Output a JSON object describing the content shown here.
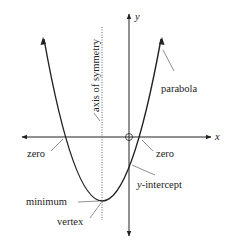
{
  "diagram": {
    "axes": {
      "x_label": "x",
      "y_label": "y"
    },
    "labels": {
      "axis_of_symmetry": "axis of symmetry",
      "parabola": "parabola",
      "zero_left": "zero",
      "zero_right": "zero",
      "y_intercept_var": "y",
      "y_intercept_rest": "-intercept",
      "minimum": "minimum",
      "vertex": "vertex"
    },
    "colors": {
      "line": "#222222",
      "background": "#ffffff"
    }
  }
}
